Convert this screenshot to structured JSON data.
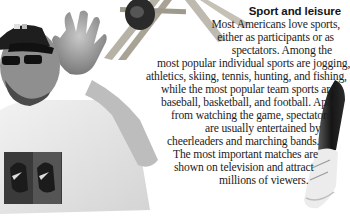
{
  "article": {
    "heading": "Sport and leisure",
    "lines": [
      "Most Americans love sports,",
      "either as participants or as",
      "spectators. Among the",
      "most popular individual sports are jogging,",
      "athletics, skiing, tennis, hunting, and fishing,",
      "while the most popular team sports are",
      "baseball, basketball, and football. Apart",
      "from watching the game, spectators",
      "are usually entertained by",
      "cheerleaders and marching bands.",
      "The most important matches are",
      "shown on television and attract",
      "millions of viewers."
    ]
  },
  "images": {
    "left": "man-in-cap-and-sunglasses-waving",
    "top": "ladder-with-figure",
    "right": "leg-with-sneaker"
  },
  "colors": {
    "background": "#ffffff",
    "text": "#1a1a1a"
  }
}
